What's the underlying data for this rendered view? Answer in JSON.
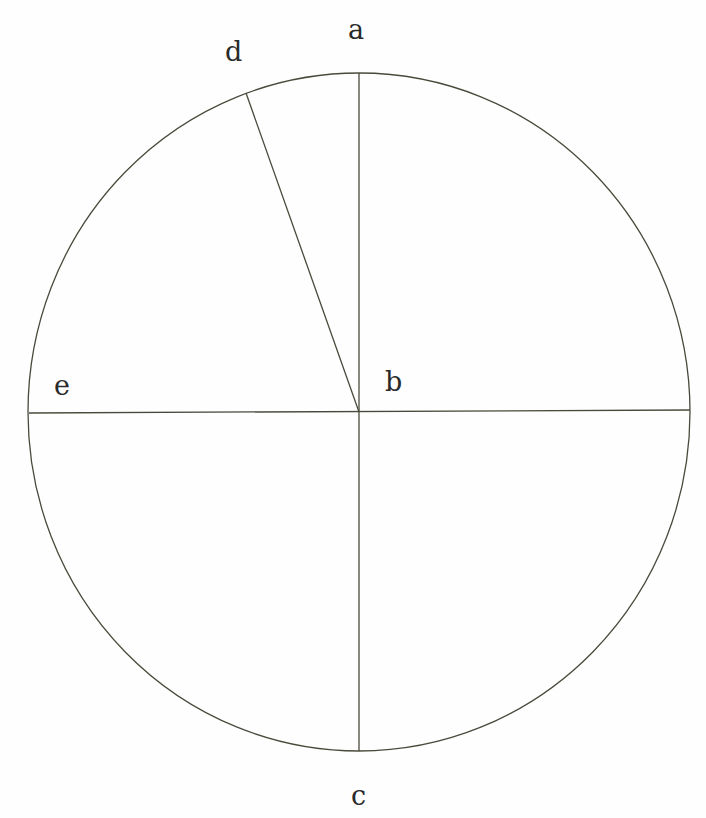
{
  "diagram": {
    "type": "circle-with-radii",
    "stroke_color": "#4a4a3c",
    "center": {
      "x": 359,
      "y": 412
    },
    "radius_x": 331,
    "radius_y": 339,
    "labels": [
      {
        "id": "a",
        "text": "a",
        "x": 348,
        "y": 16
      },
      {
        "id": "b",
        "text": "b",
        "x": 385,
        "y": 368
      },
      {
        "id": "c",
        "text": "c",
        "x": 351,
        "y": 782
      },
      {
        "id": "d",
        "text": "d",
        "x": 225,
        "y": 38
      },
      {
        "id": "e",
        "text": "e",
        "x": 54,
        "y": 372
      }
    ],
    "lines": [
      {
        "id": "vertical-diameter-a-c",
        "x1": 359,
        "y1": 73,
        "x2": 359,
        "y2": 751
      },
      {
        "id": "horizontal-diameter-e",
        "x1": 29,
        "y1": 413,
        "x2": 690,
        "y2": 410
      },
      {
        "id": "radius-b-d",
        "x1": 359,
        "y1": 412,
        "x2": 246,
        "y2": 93
      }
    ]
  }
}
